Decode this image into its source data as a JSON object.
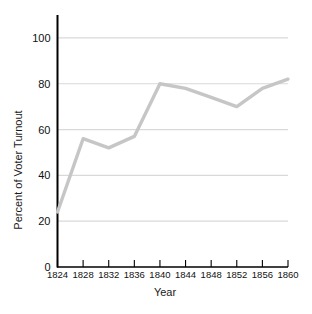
{
  "chart_data": {
    "type": "line",
    "title": "",
    "xlabel": "Year",
    "ylabel": "Percent of Voter Turnout",
    "x": [
      1824,
      1828,
      1832,
      1836,
      1840,
      1844,
      1848,
      1852,
      1856,
      1860
    ],
    "categories": [
      "1824",
      "1828",
      "1832",
      "1836",
      "1840",
      "1844",
      "1848",
      "1852",
      "1856",
      "1860"
    ],
    "values": [
      24,
      56,
      52,
      57,
      80,
      78,
      74,
      70,
      78,
      82
    ],
    "series": [
      {
        "name": "Percent of Voter Turnout",
        "values": [
          24,
          56,
          52,
          57,
          80,
          78,
          74,
          70,
          78,
          82
        ]
      }
    ],
    "xlim": [
      1824,
      1860
    ],
    "ylim": [
      0,
      110
    ],
    "ytick_labels": [
      "0",
      "20",
      "40",
      "60",
      "80",
      "100"
    ],
    "ytick_values": [
      0,
      20,
      40,
      60,
      80,
      100
    ],
    "xtick_labels": [
      "1824",
      "1828",
      "1832",
      "1836",
      "1840",
      "1844",
      "1848",
      "1852",
      "1856",
      "1860"
    ],
    "grid": "horizontal",
    "legend": "none",
    "line_color": "#c6c6c6",
    "grid_color": "#d9d9d9",
    "axis_color": "#000000",
    "background_color": "#ffffff"
  },
  "axes": {
    "y_title": "Percent of Voter Turnout",
    "x_title": "Year"
  }
}
